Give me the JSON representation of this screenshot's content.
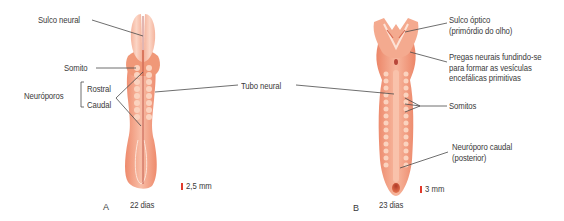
{
  "figure": {
    "panels": [
      {
        "id": "A",
        "letter": "A",
        "age": "22 dias",
        "scale_bar": "2,5 mm",
        "labels": {
          "sulco_neural": "Sulco neural",
          "somito": "Somito",
          "neuroporos": "Neuróporos",
          "rostral": "Rostral",
          "caudal": "Caudal"
        }
      },
      {
        "id": "B",
        "letter": "B",
        "age": "23 dias",
        "scale_bar": "3 mm",
        "labels": {
          "sulco_optico": "Sulco óptico\n(primórdio do olho)",
          "pregas_neurais": "Pregas neurais fundindo-se\npara formar as vesículas\nencefálicas primitivas",
          "somitos": "Somitos",
          "neuroporo_caudal": "Neuróporo caudal\n(posterior)"
        }
      }
    ],
    "shared_labels": {
      "tubo_neural": "Tubo neural"
    },
    "colors": {
      "embryo_light": "#f9c6b2",
      "embryo_mid": "#f3a487",
      "embryo_dark": "#ea7f62",
      "somite": "#fbd3bf",
      "neural_groove": "#b8473a",
      "leader_line": "#4a4a4a",
      "scale_bar": "#e23a2b",
      "text": "#3a3a3a"
    }
  }
}
